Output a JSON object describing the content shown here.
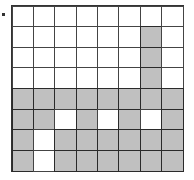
{
  "grid": {
    "rows": 8,
    "cols": 8,
    "colors": {
      "filled": "#c0c0c0",
      "empty": "#ffffff",
      "line": "#333333"
    },
    "cells": [
      [
        0,
        0,
        0,
        0,
        0,
        0,
        0,
        0
      ],
      [
        0,
        0,
        0,
        0,
        0,
        0,
        1,
        0
      ],
      [
        0,
        0,
        0,
        0,
        0,
        0,
        1,
        0
      ],
      [
        0,
        0,
        0,
        0,
        0,
        0,
        1,
        0
      ],
      [
        1,
        1,
        1,
        1,
        1,
        1,
        1,
        1
      ],
      [
        1,
        1,
        0,
        1,
        0,
        1,
        0,
        1
      ],
      [
        1,
        0,
        1,
        1,
        1,
        1,
        1,
        1
      ],
      [
        1,
        0,
        1,
        1,
        1,
        1,
        1,
        1
      ]
    ]
  }
}
